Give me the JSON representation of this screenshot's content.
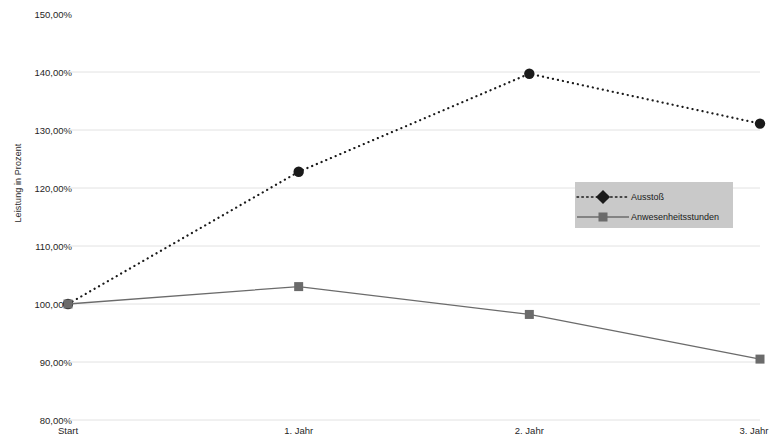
{
  "chart_data": {
    "type": "line",
    "title": "",
    "xlabel": "",
    "ylabel": "Leistung in Prozent",
    "categories": [
      "Start",
      "1. Jahr",
      "2. Jahr",
      "3. Jahr"
    ],
    "ylim": [
      80,
      150
    ],
    "ytick_labels": [
      "150,00%",
      "140,00%",
      "130,00%",
      "120,00%",
      "110,00%",
      "100,00%",
      "90,00%",
      "80,00%"
    ],
    "ytick_values": [
      150,
      140,
      130,
      120,
      110,
      100,
      90,
      80
    ],
    "grid": true,
    "grid_axis": "y",
    "legend_position": "center-right",
    "series": [
      {
        "name": "Ausstoß",
        "values": [
          100,
          122.8,
          139.7,
          131.1
        ],
        "line_style": "dotted",
        "marker": "diamond",
        "color": "#1a1a1a"
      },
      {
        "name": "Anwesenheitsstunden",
        "values": [
          100,
          103.0,
          98.2,
          90.5
        ],
        "line_style": "solid",
        "marker": "square",
        "color": "#6b6b6b"
      }
    ]
  },
  "legend": {
    "background": "#c9c9c9",
    "entries": [
      {
        "label": "Ausstoß"
      },
      {
        "label": "Anwesenheitsstunden"
      }
    ]
  },
  "axes": {
    "y_title": "Leistung in Prozent",
    "grid_color": "#e2e2e2"
  }
}
